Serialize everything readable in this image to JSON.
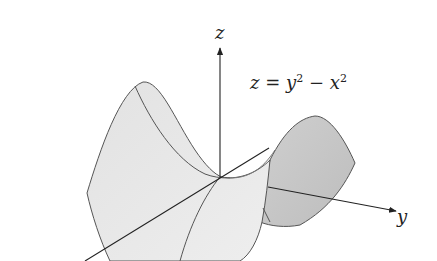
{
  "figure": {
    "equation": {
      "lhs": "z",
      "eq": " = ",
      "t1_base": "y",
      "t1_exp": "2",
      "op": " − ",
      "t2_base": "x",
      "t2_exp": "2"
    },
    "axes": {
      "z_label": "z",
      "y_label": "y",
      "x_label": ""
    },
    "colors": {
      "surface_light": "#e6e6e6",
      "surface_dark": "#c4c4c4",
      "edge": "#555555",
      "axis": "#222222",
      "background": "#ffffff"
    }
  }
}
